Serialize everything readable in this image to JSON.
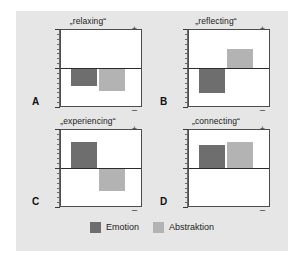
{
  "chart_data": {
    "type": "bar",
    "title": "",
    "xlabel": "",
    "ylabel": "",
    "ylim": [
      -1,
      1
    ],
    "grid": false,
    "legend_position": "bottom-center",
    "axis_ticks": [
      "+",
      "0",
      "_"
    ],
    "colors": {
      "emotion": "#6e6e6e",
      "abstraktion": "#b3b3b3",
      "background": "#e6e6e6",
      "plot_background": "#ffffff",
      "axis": "#4d4d4d"
    },
    "series": [
      {
        "name": "Emotion",
        "values": [
          -0.44,
          -0.62,
          0.7,
          0.62
        ]
      },
      {
        "name": "Abstraktion",
        "values": [
          -0.56,
          0.52,
          -0.56,
          0.7
        ]
      }
    ],
    "categories": [
      "„relaxing“",
      "„reflecting“",
      "„experiencing“",
      "„connecting“"
    ],
    "panel_letters": [
      "A",
      "B",
      "C",
      "D"
    ]
  },
  "panels": [
    {
      "letter": "A",
      "title": "„relaxing“",
      "axis": {
        "plus": "+",
        "zero": "0",
        "minus": "_"
      },
      "bars": [
        {
          "series": "Emotion",
          "value": -0.44
        },
        {
          "series": "Abstraktion",
          "value": -0.56
        }
      ]
    },
    {
      "letter": "B",
      "title": "„reflecting“",
      "axis": {
        "plus": "+",
        "zero": "0",
        "minus": "_"
      },
      "bars": [
        {
          "series": "Emotion",
          "value": -0.62
        },
        {
          "series": "Abstraktion",
          "value": 0.52
        }
      ]
    },
    {
      "letter": "C",
      "title": "„experiencing“",
      "axis": {
        "plus": "+",
        "zero": "0",
        "minus": "_"
      },
      "bars": [
        {
          "series": "Emotion",
          "value": 0.7
        },
        {
          "series": "Abstraktion",
          "value": -0.56
        }
      ]
    },
    {
      "letter": "D",
      "title": "„connecting“",
      "axis": {
        "plus": "+",
        "zero": "0",
        "minus": "_"
      },
      "bars": [
        {
          "series": "Emotion",
          "value": 0.62
        },
        {
          "series": "Abstraktion",
          "value": 0.7
        }
      ]
    }
  ],
  "legend": {
    "items": [
      {
        "label": "Emotion",
        "color": "#6e6e6e"
      },
      {
        "label": "Abstraktion",
        "color": "#b3b3b3"
      }
    ]
  }
}
